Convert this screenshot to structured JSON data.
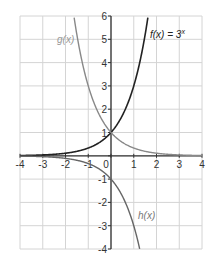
{
  "chart_data": {
    "type": "line",
    "title": "",
    "xlabel": "",
    "ylabel": "",
    "xlim": [
      -4,
      4
    ],
    "ylim": [
      -4,
      6
    ],
    "grid": true,
    "x_ticks": [
      "-4",
      "-3",
      "-2",
      "-1",
      "0",
      "1",
      "2",
      "3",
      "4"
    ],
    "y_ticks": [
      "6",
      "5",
      "4",
      "3",
      "2",
      "1",
      "-1",
      "-2",
      "-3",
      "-4"
    ],
    "series": [
      {
        "name": "f(x) = 3^x",
        "label": "f(x) = 3",
        "label_superscript": "x",
        "formula": "3^x",
        "color": "#222222",
        "x": [
          -4,
          -3,
          -2,
          -1,
          0,
          0.5,
          1,
          1.5,
          1.63
        ],
        "values": [
          0.012,
          0.037,
          0.111,
          0.333,
          1,
          1.732,
          3,
          5.196,
          6
        ]
      },
      {
        "name": "g(x)",
        "label": "g(x)",
        "formula": "3^(-x)",
        "color": "#888888",
        "x": [
          -1.63,
          -1.5,
          -1,
          -0.5,
          0,
          1,
          2,
          3,
          4
        ],
        "values": [
          6,
          5.196,
          3,
          1.732,
          1,
          0.333,
          0.111,
          0.037,
          0.012
        ]
      },
      {
        "name": "h(x)",
        "label": "h(x)",
        "formula": "-3^x",
        "color": "#666666",
        "x": [
          -4,
          -3,
          -2,
          -1,
          0,
          0.5,
          1,
          1.26
        ],
        "values": [
          -0.012,
          -0.037,
          -0.111,
          -0.333,
          -1,
          -1.732,
          -3,
          -4
        ]
      }
    ]
  }
}
